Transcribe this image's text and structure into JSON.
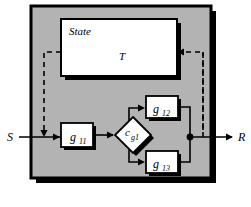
{
  "diagram": {
    "type": "block-diagram",
    "title": "",
    "canvas": {
      "width": 251,
      "height": 207,
      "background": "#ffffff"
    },
    "colors": {
      "panel_fill": "#b3b3b3",
      "panel_stroke": "#000000",
      "shadow": "#000000",
      "block_fill": "#ffffff",
      "block_stroke": "#000000",
      "line": "#000000",
      "dashed_line": "#000000"
    },
    "outer_panel": {
      "name": "system-boundary",
      "label": ""
    },
    "blocks": [
      {
        "id": "state",
        "label": "State",
        "inner_label": "T",
        "shape": "rect"
      },
      {
        "id": "g11",
        "label": "g",
        "sub": "11",
        "shape": "rect"
      },
      {
        "id": "cg1",
        "label": "c",
        "sub": "g1",
        "shape": "diamond"
      },
      {
        "id": "g12",
        "label": "g",
        "sub": "12",
        "shape": "rect"
      },
      {
        "id": "g13",
        "label": "g",
        "sub": "13",
        "shape": "rect"
      }
    ],
    "ports": [
      {
        "id": "input",
        "label": "S",
        "side": "left"
      },
      {
        "id": "output",
        "label": "R",
        "side": "right"
      }
    ],
    "junctions": [
      {
        "id": "merge-node",
        "label": ""
      }
    ],
    "feedback": {
      "left_label": "",
      "right_label": "",
      "style": "dashed"
    }
  }
}
